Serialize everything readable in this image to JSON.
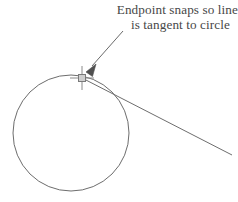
{
  "figure": {
    "background_color": "#ffffff",
    "stroke_color": "#6b6b6b",
    "text_color": "#474747",
    "marker_color": "#7a7a7a",
    "arrow_color": "#5a5a5a"
  },
  "annotation": {
    "line_1": "Endpoint snaps so line",
    "line_2": "is tangent to circle",
    "full_text": "Endpoint snaps so line is tangent to circle"
  },
  "geometry": {
    "circle": {
      "label": "circle",
      "center_x": 71,
      "center_y": 133,
      "radius": 58
    },
    "tangent_line": {
      "label": "tangent line",
      "start_x": 82,
      "start_y": 78,
      "end_x": 232,
      "end_y": 155
    },
    "snap_marker": {
      "label": "endpoint snap crosshair",
      "center_x": 82,
      "center_y": 78,
      "crosshair_arm": 12,
      "box_size": 7
    },
    "leader_arrow": {
      "label": "leader arrow",
      "tail_x": 123,
      "tail_y": 31,
      "tip_x": 86,
      "tip_y": 72
    }
  }
}
